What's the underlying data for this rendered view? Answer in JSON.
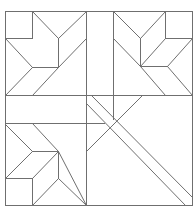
{
  "diagram": {
    "type": "quilt-block-line-drawing",
    "canvas": {
      "width": 196,
      "height": 213
    },
    "stroke_color": "#6f6f6f",
    "background": "#ffffff",
    "border": {
      "x1": 5,
      "y1": 11,
      "x2": 192,
      "y2": 205
    },
    "segments": [
      [
        86,
        11,
        86,
        205
      ],
      [
        5,
        95,
        192,
        95
      ],
      [
        5,
        123,
        104,
        123
      ],
      [
        113,
        11,
        113,
        119
      ],
      [
        5,
        38,
        32,
        38
      ],
      [
        32,
        11,
        32,
        38
      ],
      [
        32,
        11,
        58,
        38
      ],
      [
        58,
        38,
        86,
        11
      ],
      [
        58,
        38,
        58,
        67
      ],
      [
        86,
        38,
        58,
        67
      ],
      [
        5,
        38,
        32,
        67
      ],
      [
        32,
        67,
        58,
        67
      ],
      [
        32,
        67,
        5,
        95
      ],
      [
        58,
        67,
        32,
        95
      ],
      [
        165,
        11,
        165,
        38
      ],
      [
        165,
        38,
        192,
        38
      ],
      [
        113,
        11,
        140,
        38
      ],
      [
        140,
        38,
        165,
        11
      ],
      [
        140,
        38,
        140,
        66
      ],
      [
        113,
        38,
        140,
        66
      ],
      [
        140,
        66,
        165,
        38
      ],
      [
        192,
        38,
        167,
        66
      ],
      [
        140,
        66,
        167,
        66
      ],
      [
        167,
        66,
        192,
        95
      ],
      [
        140,
        66,
        165,
        95
      ],
      [
        5,
        124,
        32,
        151
      ],
      [
        32,
        123,
        58,
        151
      ],
      [
        58,
        151,
        86,
        205
      ],
      [
        32,
        151,
        58,
        151
      ],
      [
        5,
        178,
        32,
        151
      ],
      [
        32,
        178,
        58,
        151
      ],
      [
        5,
        178,
        32,
        178
      ],
      [
        32,
        178,
        32,
        205
      ],
      [
        58,
        151,
        58,
        178
      ],
      [
        32,
        205,
        58,
        178
      ],
      [
        58,
        178,
        86,
        205
      ],
      [
        91,
        95,
        192,
        197
      ],
      [
        86,
        103,
        185,
        205
      ],
      [
        142,
        95,
        86,
        151
      ]
    ]
  }
}
